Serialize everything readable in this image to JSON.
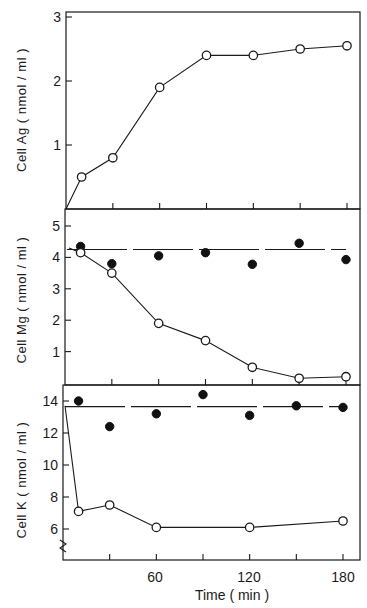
{
  "chart_data": [
    {
      "type": "line",
      "panel": "top",
      "ylabel": "Cell Ag ( nmol / ml )",
      "xlabel": "",
      "x_ticks": [
        0,
        30,
        60,
        90,
        120,
        150,
        180
      ],
      "xlim": [
        0,
        180
      ],
      "ylim": [
        0,
        3
      ],
      "y_ticks": [
        1,
        2,
        3
      ],
      "y_tick_labels": [
        "1",
        "2",
        "3"
      ],
      "grid": false,
      "series": [
        {
          "name": "Ag (open circles)",
          "marker": "open",
          "x": [
            10,
            30,
            60,
            90,
            120,
            150,
            180
          ],
          "values": [
            0.5,
            0.8,
            1.9,
            2.4,
            2.4,
            2.5,
            2.55
          ]
        }
      ]
    },
    {
      "type": "line",
      "panel": "middle",
      "ylabel": "Cell Mg ( nmol / ml )",
      "xlabel": "",
      "x_ticks": [
        0,
        30,
        60,
        90,
        120,
        150,
        180
      ],
      "xlim": [
        0,
        180
      ],
      "ylim": [
        0,
        5.5
      ],
      "y_ticks": [
        1,
        2,
        3,
        4,
        5
      ],
      "y_tick_labels": [
        "1",
        "2",
        "3",
        "4",
        "5"
      ],
      "grid": false,
      "series": [
        {
          "name": "Mg control (filled circles)",
          "marker": "filled",
          "x": [
            10,
            30,
            60,
            90,
            120,
            150,
            180
          ],
          "values": [
            4.35,
            3.8,
            4.05,
            4.15,
            3.78,
            4.45,
            3.93
          ]
        },
        {
          "name": "Mg with Ag (open circles)",
          "marker": "open",
          "x": [
            10,
            30,
            60,
            90,
            120,
            150,
            180
          ],
          "values": [
            4.15,
            3.5,
            1.9,
            1.35,
            0.5,
            0.15,
            0.2
          ]
        }
      ]
    },
    {
      "type": "line",
      "panel": "bottom",
      "ylabel": "Cell K ( nmol / ml )",
      "xlabel": "Time ( min )",
      "x_ticks": [
        0,
        30,
        60,
        90,
        120,
        150,
        180
      ],
      "x_tick_labels": [
        "60",
        "120",
        "180"
      ],
      "xlim": [
        0,
        180
      ],
      "ylim": [
        4,
        15
      ],
      "y_ticks": [
        6,
        8,
        10,
        12,
        14
      ],
      "y_tick_labels": [
        "6",
        "8",
        "10",
        "12",
        "14"
      ],
      "axis_break": true,
      "grid": false,
      "series": [
        {
          "name": "K control (filled circles)",
          "marker": "filled",
          "x": [
            10,
            30,
            60,
            90,
            120,
            150,
            180
          ],
          "values": [
            14.0,
            12.4,
            13.2,
            14.4,
            13.1,
            13.7,
            13.6
          ]
        },
        {
          "name": "K with Ag (open circles)",
          "marker": "open",
          "x": [
            10,
            30,
            60,
            120,
            180
          ],
          "values": [
            7.1,
            7.5,
            6.1,
            6.1,
            6.5
          ]
        }
      ]
    }
  ],
  "labels": {
    "top_ylabel": "Cell Ag ( nmol / ml )",
    "middle_ylabel": "Cell Mg ( nmol / ml )",
    "bottom_ylabel": "Cell K ( nmol / ml )",
    "xlabel": "Time ( min )",
    "x_tick_60": "60",
    "x_tick_120": "120",
    "x_tick_180": "180"
  },
  "colors": {
    "ink": "#1a1a1a",
    "background": "#ffffff"
  }
}
